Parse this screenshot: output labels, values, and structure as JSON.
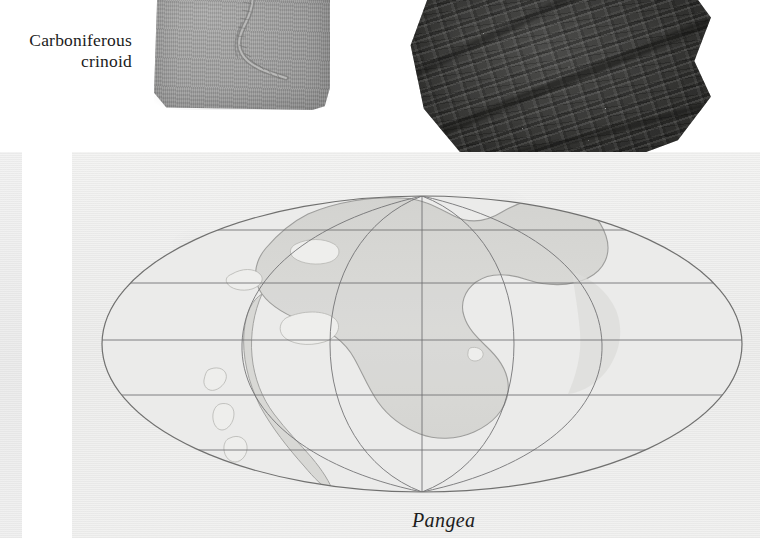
{
  "figure": {
    "caption_line1": "Carboniferous",
    "caption_line2": "crinoid",
    "map_label": "Pangea"
  },
  "photos": [
    {
      "name": "carboniferous-crinoid-fossil",
      "subject": "crinoid fossil in grey limestone slab",
      "tone": "grey"
    },
    {
      "name": "carboniferous-fern-fossil",
      "subject": "fern (seed-fern) frond fossil in dark shale",
      "tone": "dark grey"
    }
  ],
  "map": {
    "title": "Pangea",
    "projection": "Mollweide",
    "graticule": {
      "parallels_deg": [
        60,
        30,
        0,
        -30,
        -60
      ],
      "meridians_deg": [
        -120,
        -60,
        0,
        60,
        120
      ],
      "parallel_y_px": [
        230,
        283,
        340,
        395,
        450
      ],
      "equator_y_px": 340,
      "central_meridian_x_px": 422
    },
    "ellipse": {
      "cx": 422,
      "cy": 344,
      "rx": 320,
      "ry": 148
    },
    "landmasses": [
      "Pangea supercontinent"
    ],
    "inland_seas_count": 7,
    "colors": {
      "paper": "#f2f2f1",
      "land": "#d8d8d6",
      "ocean": "#ededec",
      "graticule_line": "#6e6e70",
      "outline": "#8a8a8c",
      "text": "#1d1d1d"
    }
  }
}
